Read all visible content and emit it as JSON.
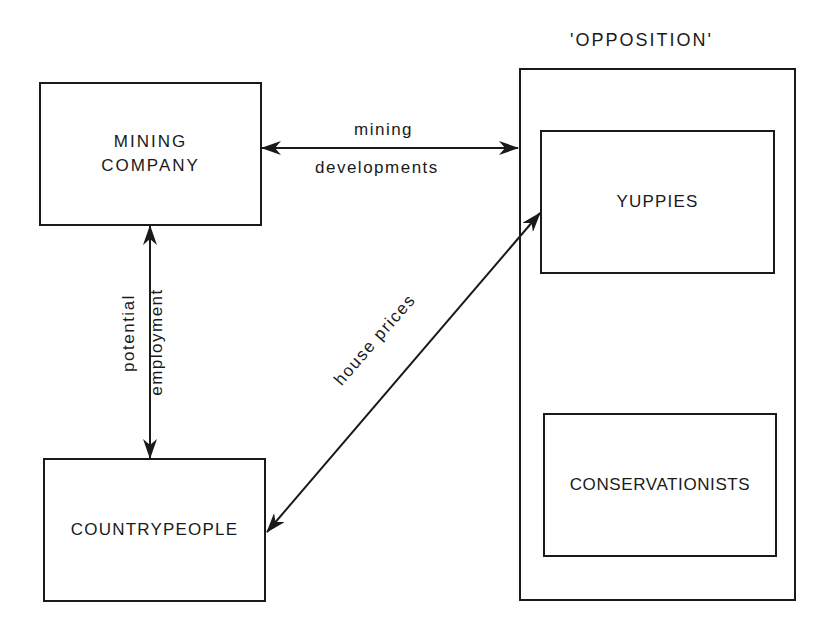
{
  "diagram": {
    "group": {
      "title": "'OPPOSITION'"
    },
    "nodes": {
      "mining_company": {
        "line1": "MINING",
        "line2": "COMPANY"
      },
      "countrypeople": {
        "label": "COUNTRYPEOPLE"
      },
      "yuppies": {
        "label": "YUPPIES"
      },
      "conservationists": {
        "label": "CONSERVATIONISTS"
      }
    },
    "edges": {
      "mining_developments": {
        "top": "mining",
        "bottom": "developments",
        "from": "MINING COMPANY",
        "to": "'OPPOSITION'",
        "direction": "bidirectional"
      },
      "potential_employment": {
        "left": "potential",
        "right": "employment",
        "from": "MINING COMPANY",
        "to": "COUNTRYPEOPLE",
        "direction": "bidirectional"
      },
      "house_prices": {
        "label": "house prices",
        "from": "COUNTRYPEOPLE",
        "to": "YUPPIES",
        "direction": "bidirectional"
      }
    }
  }
}
